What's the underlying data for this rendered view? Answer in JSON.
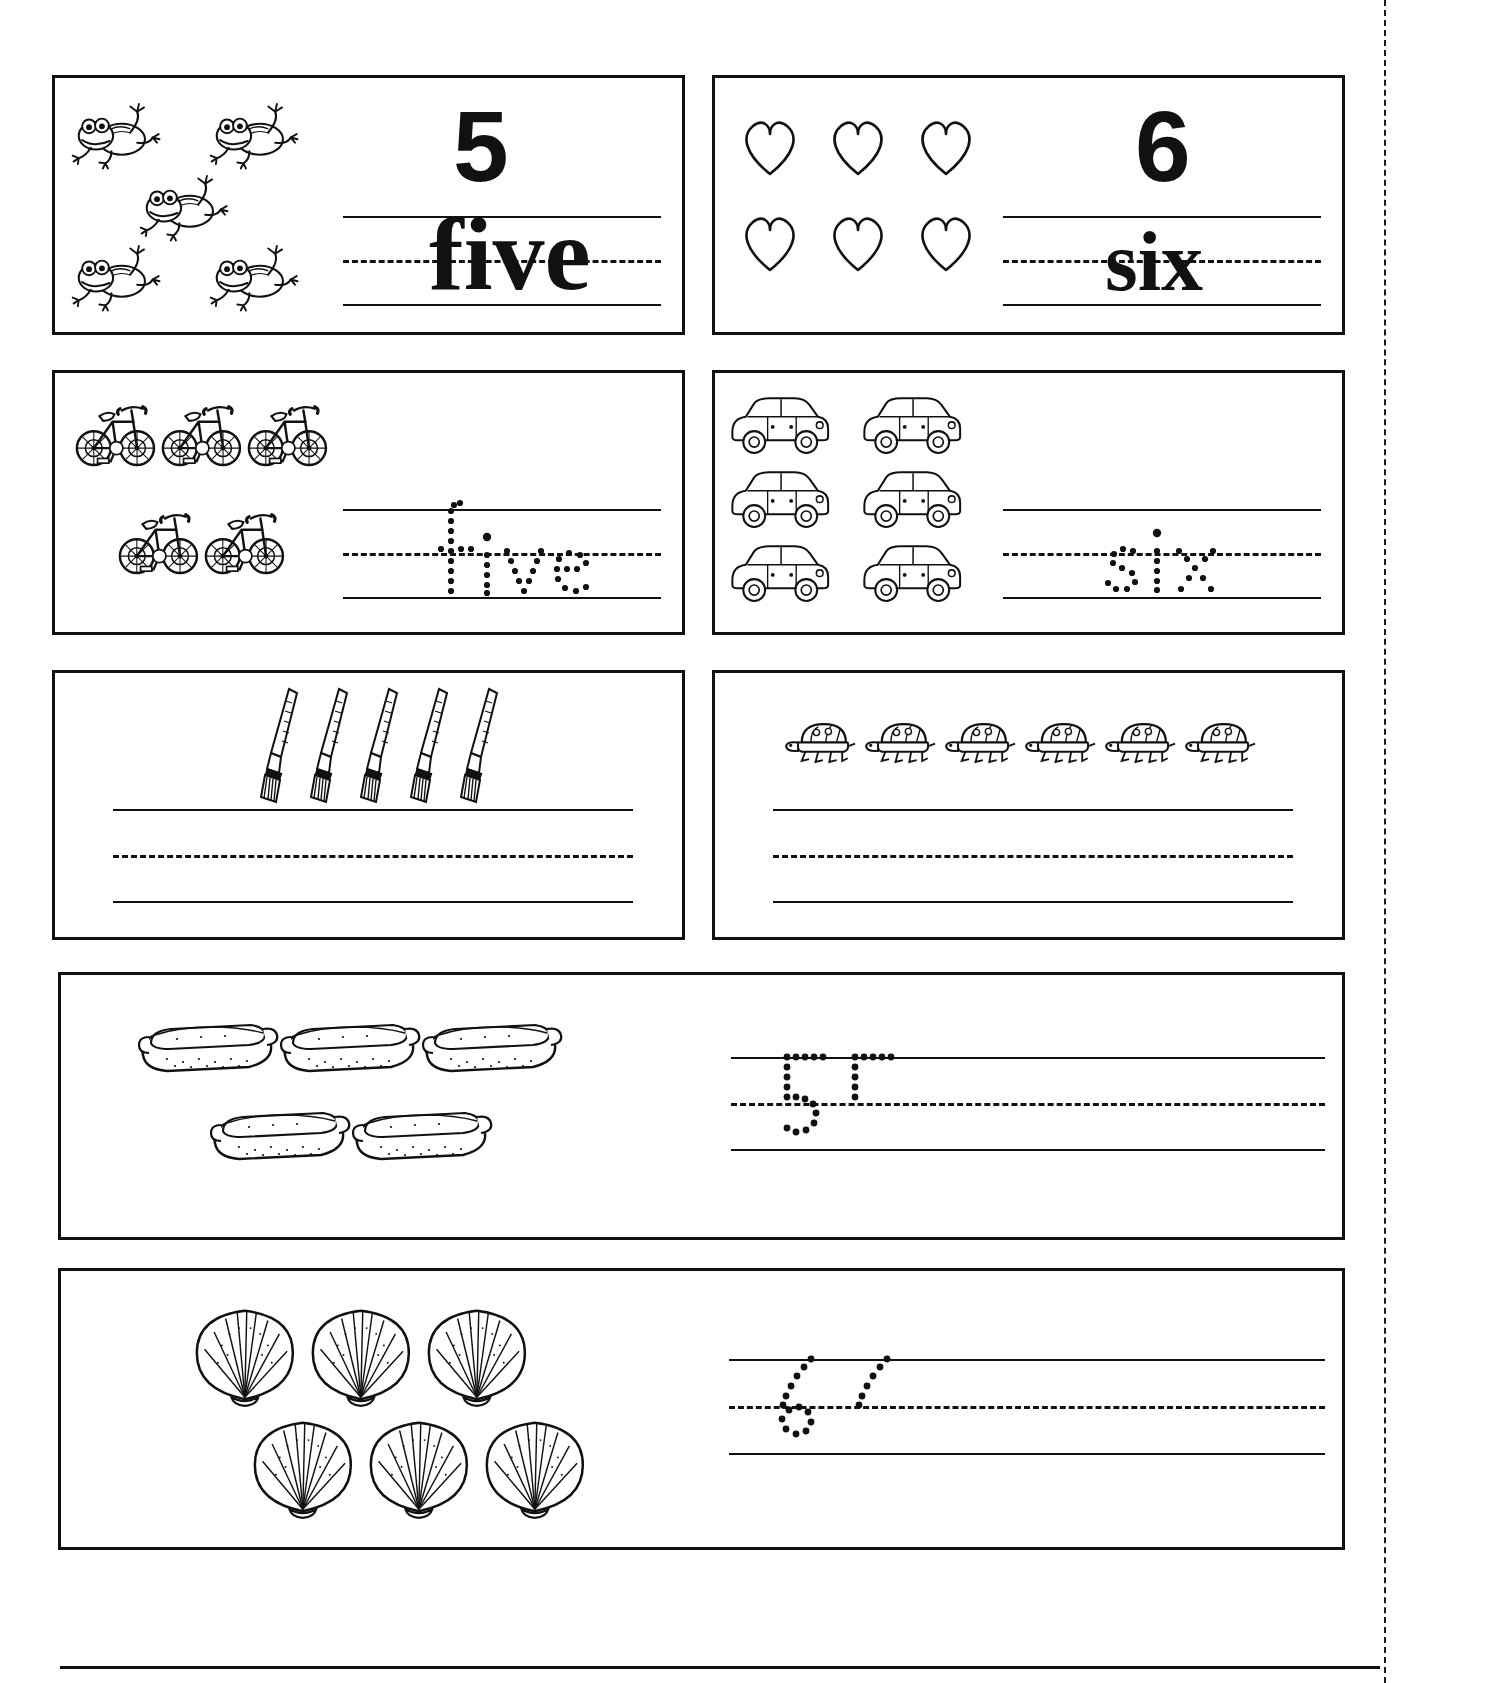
{
  "page": {
    "perforation": "dashed-perforation-line",
    "bottom_rule": "footer-rule"
  },
  "rows": [
    {
      "id": "row-1",
      "cells": [
        {
          "id": "cell-frogs-five",
          "icon": "frog-icon",
          "icon_count": 5,
          "numeral": "5",
          "word": "five",
          "word_style": "solid",
          "numeral_style": "solid",
          "layout": "2-1-2"
        },
        {
          "id": "cell-hearts-six",
          "icon": "heart-icon",
          "icon_count": 6,
          "numeral": "6",
          "word": "six",
          "word_style": "solid",
          "numeral_style": "solid",
          "layout": "3-3"
        }
      ]
    },
    {
      "id": "row-2",
      "cells": [
        {
          "id": "cell-bicycles-five",
          "icon": "bicycle-icon",
          "icon_count": 5,
          "numeral": "",
          "word": "five",
          "word_style": "dotted",
          "numeral_style": "none",
          "layout": "3-2"
        },
        {
          "id": "cell-cars-six",
          "icon": "car-icon",
          "icon_count": 6,
          "numeral": "",
          "word": "six",
          "word_style": "dotted",
          "numeral_style": "none",
          "layout": "2-2-2"
        }
      ]
    },
    {
      "id": "row-3",
      "cells": [
        {
          "id": "cell-paintbrushes-five",
          "icon": "paintbrush-icon",
          "icon_count": 5,
          "numeral": "",
          "word": "",
          "word_style": "blank",
          "numeral_style": "none",
          "layout": "5"
        },
        {
          "id": "cell-turtles-six",
          "icon": "turtle-icon",
          "icon_count": 6,
          "numeral": "",
          "word": "",
          "word_style": "blank",
          "numeral_style": "none",
          "layout": "6"
        }
      ]
    },
    {
      "id": "row-4",
      "cells": [
        {
          "id": "cell-hotdogs-five",
          "icon": "hotdog-icon",
          "icon_count": 5,
          "numeral": "5",
          "word": "",
          "word_style": "blank",
          "numeral_style": "dotted",
          "layout": "3-2",
          "full_width": true
        }
      ]
    },
    {
      "id": "row-5",
      "cells": [
        {
          "id": "cell-shells-six",
          "icon": "seashell-icon",
          "icon_count": 6,
          "numeral": "6",
          "word": "",
          "word_style": "blank",
          "numeral_style": "dotted",
          "layout": "3-3",
          "full_width": true
        }
      ]
    }
  ],
  "labels": {
    "five": "five",
    "six": "six",
    "numeral_five": "5",
    "numeral_six": "6"
  },
  "colors": {
    "ink": "#111111",
    "paper": "#ffffff"
  }
}
